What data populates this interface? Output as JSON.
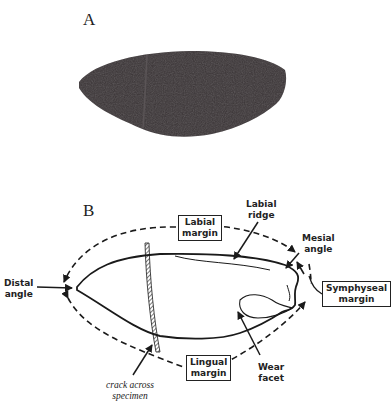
{
  "figure": {
    "panels": [
      {
        "id": "A",
        "label": "A",
        "content": "photograph of specimen"
      },
      {
        "id": "B",
        "label": "B",
        "content": "labeled line drawing of specimen"
      }
    ],
    "panel_b_labels": {
      "labial_margin": [
        "Labial",
        "margin"
      ],
      "labial_ridge": [
        "Labial",
        "ridge"
      ],
      "mesial_angle": [
        "Mesial",
        "angle"
      ],
      "distal_angle": [
        "Distal",
        "angle"
      ],
      "symphyseal_margin": [
        "Symphyseal",
        "margin"
      ],
      "lingual_margin": [
        "Lingual",
        "margin"
      ],
      "wear_facet": [
        "Wear",
        "facet"
      ],
      "crack": [
        "crack across",
        "specimen"
      ]
    },
    "colors": {
      "specimen_photo": "#3a3436",
      "ink": "#1a1a1a",
      "background": "#ffffff"
    }
  }
}
